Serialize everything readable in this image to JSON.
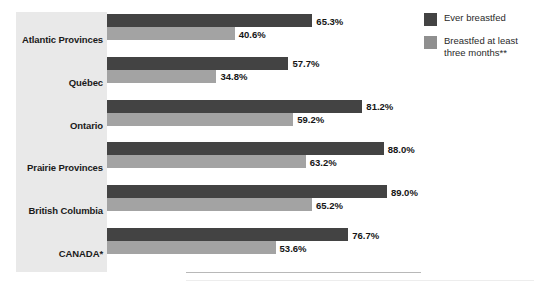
{
  "chart_data": {
    "type": "bar",
    "orientation": "horizontal",
    "title": "",
    "subtitle": "",
    "xlabel": "",
    "ylabel": "",
    "xlim": [
      0,
      100
    ],
    "grid": false,
    "legend_position": "top-right",
    "categories": [
      "Atlantic Provinces",
      "Québec",
      "Ontario",
      "Prairie Provinces",
      "British Columbia",
      "CANADA*"
    ],
    "series": [
      {
        "name": "Ever breastfed",
        "color": "#434343",
        "values": [
          65.3,
          57.7,
          81.2,
          88.0,
          89.0,
          76.7
        ],
        "labels": [
          "65.3%",
          "57.7%",
          "81.2%",
          "88.0%",
          "89.0%",
          "76.7%"
        ]
      },
      {
        "name": "Breastfed at least three months**",
        "color": "#a3a3a3",
        "values": [
          40.6,
          34.8,
          59.2,
          63.2,
          65.2,
          53.6
        ],
        "labels": [
          "40.6%",
          "34.8%",
          "59.2%",
          "63.2%",
          "65.2%",
          "53.6%"
        ]
      }
    ]
  },
  "legend": {
    "items": [
      {
        "label": "Ever breastfed",
        "swatch": "s0"
      },
      {
        "label": "Breastfed at least three months**",
        "swatch": "s1"
      }
    ]
  },
  "colors": {
    "series_dark": "#434343",
    "series_light": "#a3a3a3",
    "panel_background": "#e9e9e9",
    "page_background": "#ffffff",
    "label_text": "#1a1a1a"
  }
}
